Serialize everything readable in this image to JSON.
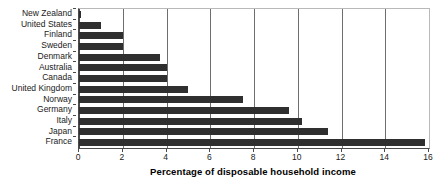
{
  "chart_data": {
    "type": "bar",
    "orientation": "horizontal",
    "title": "",
    "xlabel": "Percentage of disposable household income",
    "ylabel": "",
    "xlim": [
      0,
      16
    ],
    "xticks": [
      0,
      2,
      4,
      6,
      8,
      10,
      12,
      14,
      16
    ],
    "grid": "vertical",
    "legend": "none",
    "bar_color": "#2f2f2f",
    "categories": [
      "New Zealand",
      "United States",
      "Finland",
      "Sweden",
      "Denmark",
      "Australia",
      "Canada",
      "United Kingdom",
      "Norway",
      "Germany",
      "Italy",
      "Japan",
      "France"
    ],
    "values": [
      0.1,
      1.0,
      2.0,
      2.0,
      3.7,
      4.0,
      4.0,
      5.0,
      7.5,
      9.6,
      10.2,
      11.4,
      15.8
    ]
  }
}
